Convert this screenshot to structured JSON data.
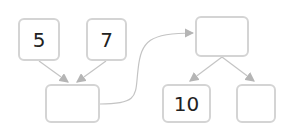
{
  "diagram": {
    "nodes": [
      {
        "id": "a",
        "label": "5"
      },
      {
        "id": "b",
        "label": "7"
      },
      {
        "id": "sum",
        "label": ""
      },
      {
        "id": "target",
        "label": ""
      },
      {
        "id": "c",
        "label": "10"
      },
      {
        "id": "d",
        "label": ""
      }
    ],
    "edges": [
      {
        "from": "a",
        "to": "sum"
      },
      {
        "from": "b",
        "to": "sum"
      },
      {
        "from": "sum",
        "to": "target"
      },
      {
        "from": "target",
        "to": "c"
      },
      {
        "from": "target",
        "to": "d"
      }
    ],
    "colors": {
      "border": "#d4d4d4",
      "arrow": "#b5b5b5",
      "text": "#222222"
    }
  }
}
